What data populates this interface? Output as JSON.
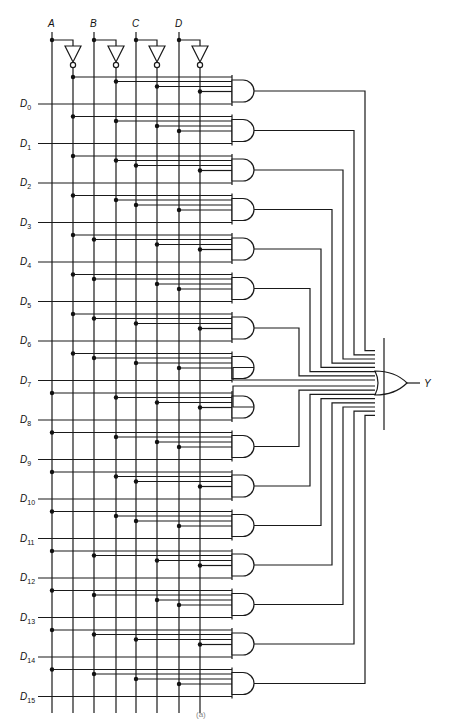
{
  "diagram": {
    "select_inputs": [
      "A",
      "B",
      "C",
      "D"
    ],
    "data_inputs": [
      "D0",
      "D1",
      "D2",
      "D3",
      "D4",
      "D5",
      "D6",
      "D7",
      "D8",
      "D9",
      "D10",
      "D11",
      "D12",
      "D13",
      "D14",
      "D15"
    ],
    "data_label_prefix": "D",
    "output_label": "Y",
    "gate_count": 16,
    "and_gate_type": "5-input AND",
    "or_gate_type": "16-input OR",
    "select_code_msb_first": [
      "0000",
      "0001",
      "0010",
      "0011",
      "0100",
      "0101",
      "0110",
      "0111",
      "1000",
      "1001",
      "1010",
      "1011",
      "1100",
      "1101",
      "1110",
      "1111"
    ],
    "caption": "(a)",
    "colors": {
      "line": "#1a1a1a",
      "background": "#ffffff"
    }
  }
}
